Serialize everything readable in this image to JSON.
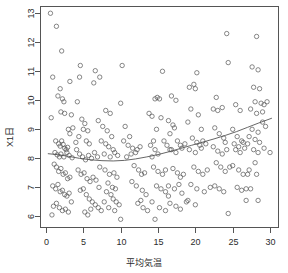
{
  "chart_data": {
    "type": "scatter",
    "title": "",
    "subtitle": "",
    "xlabel": "平均気温",
    "ylabel": "X1日",
    "xlim": [
      -0.8,
      31.2
    ],
    "ylim": [
      5.6,
      13.25
    ],
    "grid": false,
    "legend": null,
    "xticks": [
      0,
      5,
      10,
      15,
      20,
      25,
      30
    ],
    "xtick_labels": [
      "0",
      "5",
      "10",
      "15",
      "20",
      "25",
      "30"
    ],
    "yticks": [
      6,
      7,
      8,
      9,
      10,
      11,
      12,
      13
    ],
    "ytick_labels": [
      "6",
      "7",
      "8",
      "9",
      "10",
      "11",
      "12",
      "13"
    ],
    "point_style": {
      "marker": "open-circle",
      "radius_px": 2.2,
      "stroke": "#555555",
      "fill": "none",
      "stroke_width": 0.7
    },
    "trend_line": {
      "name": "lowess smoother",
      "color": "#555555",
      "width": 0.9,
      "x": [
        0.3,
        1.5,
        3.0,
        4.5,
        6.0,
        7.5,
        9.0,
        10.5,
        12.0,
        13.5,
        15.0,
        16.5,
        18.0,
        19.5,
        21.0,
        22.5,
        24.0,
        25.5,
        27.0,
        28.5,
        30.2
      ],
      "y": [
        8.16,
        8.13,
        8.07,
        8.0,
        7.95,
        7.92,
        7.91,
        7.93,
        7.98,
        8.05,
        8.13,
        8.23,
        8.34,
        8.45,
        8.56,
        8.67,
        8.79,
        8.92,
        9.07,
        9.22,
        9.38
      ]
    },
    "points": [
      [
        0.6,
        13.0
      ],
      [
        1.4,
        12.55
      ],
      [
        2.1,
        11.7
      ],
      [
        4.6,
        11.2
      ],
      [
        0.9,
        10.8
      ],
      [
        3.2,
        10.65
      ],
      [
        4.5,
        10.8
      ],
      [
        6.6,
        11.02
      ],
      [
        1.6,
        10.15
      ],
      [
        1.9,
        10.4
      ],
      [
        2.4,
        9.95
      ],
      [
        2.2,
        10.05
      ],
      [
        0.7,
        9.4
      ],
      [
        2.0,
        9.6
      ],
      [
        2.5,
        9.55
      ],
      [
        3.4,
        9.5
      ],
      [
        3.0,
        9.0
      ],
      [
        3.2,
        8.85
      ],
      [
        3.6,
        9.05
      ],
      [
        4.0,
        8.55
      ],
      [
        1.3,
        8.6
      ],
      [
        1.7,
        8.5
      ],
      [
        1.9,
        8.42
      ],
      [
        2.1,
        8.6
      ],
      [
        2.3,
        8.48
      ],
      [
        2.5,
        8.35
      ],
      [
        2.7,
        8.3
      ],
      [
        2.9,
        8.38
      ],
      [
        1.2,
        8.2
      ],
      [
        1.5,
        8.12
      ],
      [
        1.8,
        8.05
      ],
      [
        2.0,
        8.15
      ],
      [
        2.4,
        8.05
      ],
      [
        2.8,
        8.2
      ],
      [
        3.1,
        8.1
      ],
      [
        3.5,
        8.02
      ],
      [
        1.1,
        7.8
      ],
      [
        1.4,
        7.7
      ],
      [
        1.7,
        7.55
      ],
      [
        2.0,
        7.65
      ],
      [
        2.3,
        7.45
      ],
      [
        2.6,
        7.5
      ],
      [
        2.9,
        7.3
      ],
      [
        3.2,
        7.35
      ],
      [
        0.9,
        7.05
      ],
      [
        1.3,
        6.95
      ],
      [
        1.6,
        7.1
      ],
      [
        1.9,
        6.85
      ],
      [
        2.2,
        6.9
      ],
      [
        2.5,
        6.75
      ],
      [
        2.8,
        6.7
      ],
      [
        3.1,
        6.8
      ],
      [
        1.0,
        6.35
      ],
      [
        1.4,
        6.45
      ],
      [
        1.8,
        6.3
      ],
      [
        2.2,
        6.2
      ],
      [
        2.6,
        6.25
      ],
      [
        3.0,
        6.15
      ],
      [
        0.8,
        6.05
      ],
      [
        3.4,
        6.5
      ],
      [
        4.2,
        9.95
      ],
      [
        4.8,
        9.35
      ],
      [
        5.2,
        9.2
      ],
      [
        5.6,
        8.95
      ],
      [
        4.4,
        8.75
      ],
      [
        5.0,
        9.0
      ],
      [
        5.4,
        8.6
      ],
      [
        5.8,
        8.5
      ],
      [
        4.1,
        8.3
      ],
      [
        4.5,
        8.15
      ],
      [
        4.9,
        8.05
      ],
      [
        5.3,
        7.95
      ],
      [
        5.7,
        8.1
      ],
      [
        6.1,
        8.0
      ],
      [
        6.5,
        8.2
      ],
      [
        6.9,
        8.05
      ],
      [
        4.3,
        7.6
      ],
      [
        4.7,
        7.45
      ],
      [
        5.1,
        7.5
      ],
      [
        5.5,
        7.3
      ],
      [
        5.9,
        7.2
      ],
      [
        6.3,
        7.35
      ],
      [
        6.7,
        7.25
      ],
      [
        7.1,
        7.0
      ],
      [
        4.6,
        6.9
      ],
      [
        5.0,
        6.95
      ],
      [
        5.4,
        6.75
      ],
      [
        5.8,
        6.6
      ],
      [
        6.2,
        6.5
      ],
      [
        6.6,
        6.4
      ],
      [
        7.0,
        6.3
      ],
      [
        7.4,
        6.2
      ],
      [
        5.2,
        6.15
      ],
      [
        5.6,
        6.05
      ],
      [
        6.0,
        6.25
      ],
      [
        7.8,
        6.5
      ],
      [
        6.4,
        10.6
      ],
      [
        7.2,
        10.8
      ],
      [
        8.0,
        9.65
      ],
      [
        8.6,
        9.55
      ],
      [
        7.0,
        9.3
      ],
      [
        7.6,
        9.1
      ],
      [
        8.2,
        8.95
      ],
      [
        8.8,
        8.75
      ],
      [
        7.4,
        8.6
      ],
      [
        8.0,
        8.5
      ],
      [
        8.4,
        8.4
      ],
      [
        9.0,
        8.3
      ],
      [
        7.8,
        8.15
      ],
      [
        8.6,
        8.05
      ],
      [
        9.2,
        8.2
      ],
      [
        9.6,
        8.1
      ],
      [
        7.2,
        7.7
      ],
      [
        7.9,
        7.6
      ],
      [
        8.5,
        7.45
      ],
      [
        9.1,
        7.5
      ],
      [
        9.5,
        7.35
      ],
      [
        8.3,
        7.15
      ],
      [
        8.9,
        7.0
      ],
      [
        9.3,
        6.95
      ],
      [
        8.1,
        6.85
      ],
      [
        8.7,
        6.75
      ],
      [
        9.0,
        6.6
      ],
      [
        9.4,
        6.5
      ],
      [
        9.8,
        6.4
      ],
      [
        8.4,
        6.3
      ],
      [
        9.2,
        6.2
      ],
      [
        10.0,
        5.9
      ],
      [
        10.2,
        11.2
      ],
      [
        10.0,
        9.9
      ],
      [
        10.6,
        9.1
      ],
      [
        11.2,
        8.75
      ],
      [
        10.4,
        8.6
      ],
      [
        11.0,
        8.45
      ],
      [
        11.6,
        8.35
      ],
      [
        12.0,
        8.2
      ],
      [
        10.8,
        8.05
      ],
      [
        11.4,
        8.15
      ],
      [
        12.2,
        8.3
      ],
      [
        12.6,
        8.4
      ],
      [
        11.8,
        7.75
      ],
      [
        12.4,
        7.6
      ],
      [
        12.8,
        7.45
      ],
      [
        13.2,
        7.5
      ],
      [
        11.5,
        7.2
      ],
      [
        12.1,
        7.05
      ],
      [
        12.9,
        6.9
      ],
      [
        13.4,
        6.75
      ],
      [
        12.3,
        6.45
      ],
      [
        13.0,
        6.3
      ],
      [
        13.6,
        6.2
      ],
      [
        12.7,
        6.55
      ],
      [
        13.8,
        9.55
      ],
      [
        14.2,
        9.45
      ],
      [
        14.8,
        9.0
      ],
      [
        14.4,
        8.6
      ],
      [
        14.0,
        8.45
      ],
      [
        14.6,
        8.3
      ],
      [
        15.0,
        8.15
      ],
      [
        14.2,
        8.05
      ],
      [
        14.6,
        10.05
      ],
      [
        14.9,
        10.1
      ],
      [
        15.2,
        10.05
      ],
      [
        15.6,
        11.0
      ],
      [
        15.4,
        9.4
      ],
      [
        15.8,
        8.6
      ],
      [
        16.2,
        8.45
      ],
      [
        16.6,
        8.3
      ],
      [
        14.4,
        7.7
      ],
      [
        15.0,
        7.55
      ],
      [
        15.6,
        7.45
      ],
      [
        16.0,
        7.6
      ],
      [
        14.8,
        7.05
      ],
      [
        15.4,
        6.95
      ],
      [
        16.0,
        6.85
      ],
      [
        16.4,
        6.7
      ],
      [
        14.2,
        6.5
      ],
      [
        15.2,
        6.3
      ],
      [
        16.0,
        6.2
      ],
      [
        14.6,
        5.9
      ],
      [
        16.8,
        10.15
      ],
      [
        17.4,
        10.0
      ],
      [
        16.4,
        9.3
      ],
      [
        17.0,
        9.15
      ],
      [
        17.2,
        9.05
      ],
      [
        16.6,
        8.85
      ],
      [
        17.6,
        8.6
      ],
      [
        18.0,
        8.45
      ],
      [
        16.8,
        8.3
      ],
      [
        17.4,
        8.2
      ],
      [
        18.2,
        8.35
      ],
      [
        18.6,
        8.5
      ],
      [
        17.0,
        7.65
      ],
      [
        17.6,
        7.5
      ],
      [
        18.0,
        7.35
      ],
      [
        18.4,
        7.45
      ],
      [
        16.4,
        7.05
      ],
      [
        17.2,
        6.95
      ],
      [
        17.8,
        7.1
      ],
      [
        18.2,
        6.8
      ],
      [
        16.6,
        6.45
      ],
      [
        17.4,
        6.35
      ],
      [
        18.0,
        6.25
      ],
      [
        18.8,
        6.5
      ],
      [
        19.2,
        10.45
      ],
      [
        19.8,
        10.55
      ],
      [
        20.2,
        10.95
      ],
      [
        20.0,
        10.4
      ],
      [
        19.4,
        9.7
      ],
      [
        20.4,
        9.5
      ],
      [
        19.0,
        9.25
      ],
      [
        20.8,
        9.0
      ],
      [
        19.6,
        8.7
      ],
      [
        20.2,
        8.55
      ],
      [
        20.6,
        8.45
      ],
      [
        21.0,
        8.6
      ],
      [
        19.2,
        8.3
      ],
      [
        20.0,
        8.2
      ],
      [
        20.8,
        8.35
      ],
      [
        21.4,
        8.5
      ],
      [
        19.8,
        7.7
      ],
      [
        20.4,
        7.55
      ],
      [
        21.0,
        7.45
      ],
      [
        21.6,
        7.6
      ],
      [
        19.4,
        7.1
      ],
      [
        20.2,
        6.95
      ],
      [
        21.2,
        6.85
      ],
      [
        22.0,
        7.0
      ],
      [
        19.0,
        6.55
      ],
      [
        20.0,
        6.4
      ],
      [
        22.4,
        9.7
      ],
      [
        23.0,
        9.65
      ],
      [
        22.8,
        10.1
      ],
      [
        24.2,
        12.3
      ],
      [
        24.4,
        11.3
      ],
      [
        23.6,
        9.75
      ],
      [
        22.6,
        9.05
      ],
      [
        23.2,
        8.85
      ],
      [
        23.8,
        8.7
      ],
      [
        24.0,
        8.55
      ],
      [
        22.4,
        8.4
      ],
      [
        23.0,
        8.25
      ],
      [
        23.6,
        8.15
      ],
      [
        24.2,
        8.3
      ],
      [
        22.8,
        7.85
      ],
      [
        23.4,
        7.7
      ],
      [
        24.0,
        7.55
      ],
      [
        24.6,
        7.7
      ],
      [
        22.6,
        7.05
      ],
      [
        23.2,
        6.95
      ],
      [
        23.8,
        6.85
      ],
      [
        24.4,
        6.1
      ],
      [
        25.4,
        9.85
      ],
      [
        26.0,
        9.65
      ],
      [
        25.0,
        9.0
      ],
      [
        25.6,
        8.75
      ],
      [
        26.2,
        8.6
      ],
      [
        25.2,
        8.5
      ],
      [
        25.8,
        8.4
      ],
      [
        26.4,
        8.55
      ],
      [
        25.4,
        8.3
      ],
      [
        26.0,
        8.2
      ],
      [
        26.6,
        8.35
      ],
      [
        27.0,
        8.5
      ],
      [
        25.0,
        7.75
      ],
      [
        25.8,
        7.6
      ],
      [
        26.4,
        7.45
      ],
      [
        27.2,
        7.6
      ],
      [
        25.6,
        7.0
      ],
      [
        26.2,
        6.9
      ],
      [
        27.4,
        6.95
      ],
      [
        26.8,
        6.55
      ],
      [
        27.6,
        11.15
      ],
      [
        28.2,
        12.2
      ],
      [
        28.4,
        11.05
      ],
      [
        27.8,
        10.45
      ],
      [
        28.6,
        10.4
      ],
      [
        28.0,
        9.95
      ],
      [
        28.8,
        9.9
      ],
      [
        29.2,
        9.85
      ],
      [
        27.4,
        9.7
      ],
      [
        28.2,
        9.55
      ],
      [
        29.0,
        9.6
      ],
      [
        29.6,
        9.95
      ],
      [
        27.6,
        9.0
      ],
      [
        28.4,
        8.9
      ],
      [
        29.0,
        9.25
      ],
      [
        29.4,
        9.1
      ],
      [
        27.2,
        8.75
      ],
      [
        28.0,
        8.65
      ],
      [
        28.6,
        8.55
      ],
      [
        29.2,
        8.35
      ],
      [
        27.8,
        8.3
      ],
      [
        28.4,
        8.2
      ],
      [
        30.0,
        8.2
      ],
      [
        28.0,
        7.85
      ],
      [
        27.0,
        7.45
      ],
      [
        28.2,
        7.45
      ],
      [
        26.8,
        6.95
      ],
      [
        28.4,
        6.55
      ]
    ]
  }
}
